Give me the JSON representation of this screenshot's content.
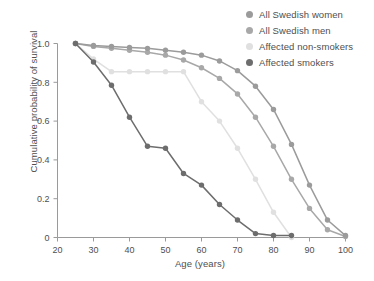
{
  "chart_data": {
    "type": "line",
    "title": "",
    "xlabel": "Age (years)",
    "ylabel": "Cumulative probability of survival",
    "xlim": [
      20,
      100
    ],
    "ylim": [
      0,
      1.0
    ],
    "xticks": [
      20,
      30,
      40,
      50,
      60,
      70,
      80,
      90,
      100
    ],
    "xtick_labels": [
      "20",
      "30",
      "40",
      "50",
      "60",
      "70",
      "80",
      "90",
      "100"
    ],
    "yticks": [
      0,
      0.2,
      0.4,
      0.6,
      0.8,
      1.0
    ],
    "ytick_labels": [
      "0",
      "0.2",
      "0.4",
      "0.6",
      "0.8",
      "1.0"
    ],
    "grid": false,
    "legend_position": "top-right",
    "markers": "circle",
    "series": [
      {
        "name": "All Swedish women",
        "color": "#9b9b9b",
        "x": [
          25,
          30,
          35,
          40,
          45,
          50,
          55,
          60,
          65,
          70,
          75,
          80,
          85,
          90,
          95,
          100
        ],
        "values": [
          1.0,
          0.99,
          0.985,
          0.98,
          0.975,
          0.965,
          0.955,
          0.94,
          0.91,
          0.86,
          0.78,
          0.66,
          0.48,
          0.27,
          0.09,
          0.01
        ]
      },
      {
        "name": "All Swedish men",
        "color": "#a8a8a8",
        "x": [
          25,
          30,
          35,
          40,
          45,
          50,
          55,
          60,
          65,
          70,
          75,
          80,
          85,
          90,
          95,
          100
        ],
        "values": [
          1.0,
          0.985,
          0.975,
          0.965,
          0.955,
          0.94,
          0.915,
          0.875,
          0.82,
          0.74,
          0.62,
          0.47,
          0.3,
          0.15,
          0.04,
          0.005
        ]
      },
      {
        "name": "Affected non-smokers",
        "color": "#e0e0e0",
        "x": [
          25,
          30,
          35,
          40,
          45,
          50,
          55,
          60,
          65,
          70,
          75,
          80,
          85
        ],
        "values": [
          1.0,
          0.92,
          0.855,
          0.855,
          0.855,
          0.855,
          0.855,
          0.7,
          0.6,
          0.46,
          0.3,
          0.13,
          0.0
        ]
      },
      {
        "name": "Affected smokers",
        "color": "#6d6d6d",
        "x": [
          25,
          30,
          35,
          40,
          45,
          50,
          55,
          60,
          65,
          70,
          75,
          80,
          85
        ],
        "values": [
          1.0,
          0.905,
          0.785,
          0.62,
          0.47,
          0.46,
          0.33,
          0.27,
          0.17,
          0.09,
          0.02,
          0.01,
          0.01
        ]
      }
    ]
  },
  "legend": {
    "items": [
      {
        "label": "All Swedish women",
        "color": "#9b9b9b"
      },
      {
        "label": "All Swedish men",
        "color": "#a8a8a8"
      },
      {
        "label": "Affected non-smokers",
        "color": "#e0e0e0"
      },
      {
        "label": "Affected smokers",
        "color": "#6d6d6d"
      }
    ]
  }
}
